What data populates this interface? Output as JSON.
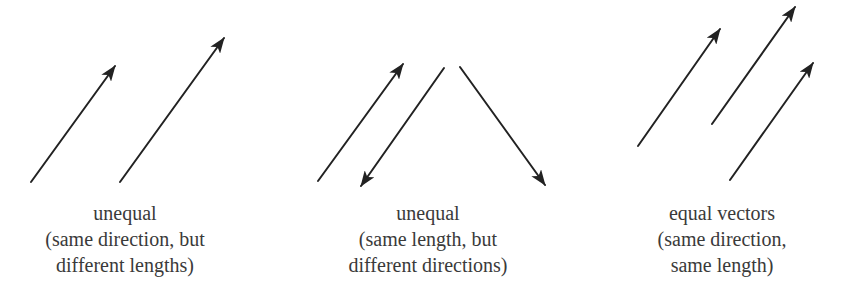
{
  "colors": {
    "background": "#ffffff",
    "arrow": "#222222",
    "text": "#3a3a3a"
  },
  "groups": [
    {
      "id": "unequal-lengths",
      "caption_center_x": 125,
      "caption": {
        "line1": "unequal",
        "line2": "(same direction, but",
        "line3": "different lengths)"
      },
      "vectors": [
        {
          "x1": 31,
          "y1": 182,
          "x2": 115,
          "y2": 66
        },
        {
          "x1": 120,
          "y1": 182,
          "x2": 224,
          "y2": 38
        }
      ]
    },
    {
      "id": "unequal-directions",
      "caption_center_x": 428,
      "caption": {
        "line1": "unequal",
        "line2": "(same length, but",
        "line3": "different directions)"
      },
      "vectors": [
        {
          "x1": 318,
          "y1": 181,
          "x2": 403,
          "y2": 64
        },
        {
          "x1": 444,
          "y1": 68,
          "x2": 361,
          "y2": 186
        },
        {
          "x1": 460,
          "y1": 67,
          "x2": 545,
          "y2": 185
        }
      ]
    },
    {
      "id": "equal-vectors",
      "caption_center_x": 722,
      "caption": {
        "line1": "equal vectors",
        "line2": "(same direction,",
        "line3": "same length)"
      },
      "vectors": [
        {
          "x1": 638,
          "y1": 146,
          "x2": 720,
          "y2": 29
        },
        {
          "x1": 712,
          "y1": 124,
          "x2": 795,
          "y2": 7
        },
        {
          "x1": 730,
          "y1": 180,
          "x2": 813,
          "y2": 63
        }
      ]
    }
  ]
}
